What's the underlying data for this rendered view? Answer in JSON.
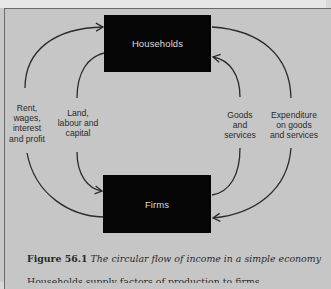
{
  "diagram": {
    "nodes": {
      "households": "Households",
      "firms": "Firms"
    },
    "flows": [
      {
        "id": "rent",
        "label": "Rent,\nwages,\ninterest\nand profit",
        "from": "firms",
        "to": "households"
      },
      {
        "id": "land",
        "label": "Land,\nlabour and\ncapital",
        "from": "households",
        "to": "firms"
      },
      {
        "id": "goods",
        "label": "Goods\nand\nservices",
        "from": "firms",
        "to": "households"
      },
      {
        "id": "expenditure",
        "label": "Expenditure\non goods\nand services",
        "from": "households",
        "to": "firms"
      }
    ],
    "colors": {
      "box_fill": "#050505",
      "box_text": "#dcdcdc",
      "line": "#2b2b2b",
      "background": "#c6c6c6"
    }
  },
  "caption": {
    "number": "Figure 56.1",
    "text": "The circular flow of income in a simple economy",
    "next_line_partial": "Households supply factors of production to firms"
  }
}
